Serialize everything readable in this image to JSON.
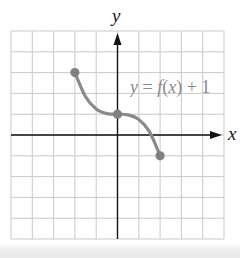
{
  "chart_data": {
    "type": "line",
    "title": "",
    "xlabel": "x",
    "ylabel": "y",
    "xlim": [
      -5,
      5
    ],
    "ylim": [
      -5,
      5
    ],
    "grid": true,
    "grid_step": 1,
    "legend": null,
    "annotations": [
      {
        "text": "y = f(x) + 1",
        "x": 0.6,
        "y": 2.4,
        "color": "#8a8a8a"
      }
    ],
    "series": [
      {
        "name": "y = f(x) + 1",
        "color": "#8a8a8a",
        "x": [
          -2,
          -1.5,
          -1,
          -0.5,
          0,
          0.5,
          1,
          1.5,
          2
        ],
        "values": [
          3,
          1.84,
          1.25,
          1.03,
          1,
          0.97,
          0.75,
          0.16,
          -1
        ],
        "key_points": [
          [
            -2,
            3
          ],
          [
            0,
            1
          ],
          [
            2,
            -1
          ]
        ],
        "endpoints_closed": true
      }
    ]
  },
  "labels": {
    "x_axis": "x",
    "y_axis": "y",
    "curve_var": "y",
    "curve_eq": " = ",
    "curve_f": "f",
    "curve_arg_open": "(",
    "curve_arg": "x",
    "curve_arg_close": ")",
    "curve_tail": " + 1"
  },
  "colors": {
    "grid": "#c9c9c9",
    "axes": "#111111",
    "curve": "#8a8a8a",
    "points": "#808080"
  }
}
